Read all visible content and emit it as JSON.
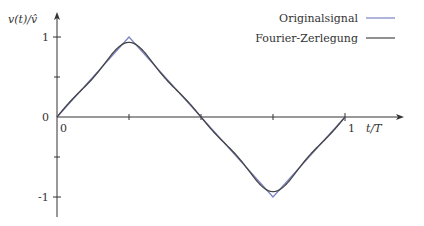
{
  "chart_data": {
    "type": "line",
    "title": "",
    "xlabel": "t/T",
    "ylabel": "v(t)/v̂",
    "xlim": [
      0,
      1
    ],
    "ylim": [
      -1.2,
      1.2
    ],
    "x_ticks": [
      0,
      0.25,
      0.5,
      0.75,
      1
    ],
    "x_tick_labels": [
      "0",
      "",
      "",
      "",
      "1"
    ],
    "y_ticks": [
      -1,
      -0.5,
      0,
      0.5,
      1
    ],
    "y_tick_labels": [
      "-1",
      "",
      "0",
      "",
      "1"
    ],
    "grid": false,
    "legend_position": "top-right",
    "series": [
      {
        "name": "Originalsignal",
        "color": "#7b83c4",
        "description": "triangle wave",
        "x": [
          0,
          0.25,
          0.5,
          0.75,
          1
        ],
        "values": [
          0,
          1,
          0,
          -1,
          0
        ]
      },
      {
        "name": "Fourier-Zerlegung",
        "color": "#444444",
        "description": "truncated Fourier series of triangle wave (harmonics 1,3,5)",
        "harmonics": [
          1,
          3,
          5
        ],
        "x": [
          0,
          0.125,
          0.25,
          0.375,
          0.5,
          0.625,
          0.75,
          0.875,
          1
        ],
        "values": [
          0,
          0.5,
          0.95,
          0.5,
          0,
          -0.5,
          -0.95,
          -0.5,
          0
        ]
      }
    ]
  },
  "axes": {
    "y_label": "v(t)/v̂",
    "x_label": "t/T",
    "y_tick_1": "1",
    "y_tick_0": "0",
    "y_tick_m1": "-1",
    "x_tick_0": "0",
    "x_tick_1": "1"
  },
  "legend": {
    "items": [
      {
        "label": "Originalsignal",
        "color": "#7b83c4"
      },
      {
        "label": "Fourier-Zerlegung",
        "color": "#444444"
      }
    ]
  }
}
